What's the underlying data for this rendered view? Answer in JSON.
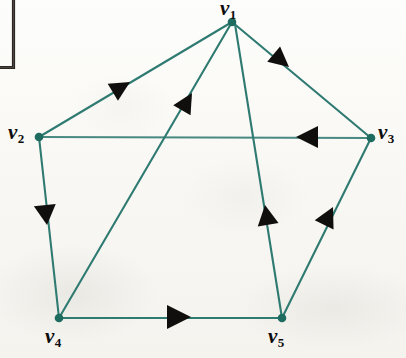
{
  "figure": {
    "kind": "directed-graph-diagram",
    "background_color": "#fbfbf8",
    "edge_color": "#2f7a71",
    "vertex_color": "#1e6b60",
    "arrow_color": "#100f0d",
    "label_color": "#0d0d0d"
  },
  "corner_bracket": {
    "name": "corner-bracket-mark",
    "color": "#2a2622",
    "x": 13,
    "y_top": 0,
    "y_bottom": 68,
    "x_left": 0
  },
  "vertices": [
    {
      "id": "v1",
      "label": "v",
      "subscript": "1",
      "cx": 232,
      "cy": 22,
      "label_x": 220,
      "label_y": -2
    },
    {
      "id": "v2",
      "label": "v",
      "subscript": "2",
      "cx": 39,
      "cy": 137,
      "label_x": 8,
      "label_y": 122
    },
    {
      "id": "v3",
      "label": "v",
      "subscript": "3",
      "cx": 371,
      "cy": 138,
      "label_x": 378,
      "label_y": 122
    },
    {
      "id": "v4",
      "label": "v",
      "subscript": "4",
      "cx": 59,
      "cy": 318,
      "label_x": 45,
      "label_y": 326
    },
    {
      "id": "v5",
      "label": "v",
      "subscript": "5",
      "cx": 282,
      "cy": 318,
      "label_x": 268,
      "label_y": 326
    }
  ],
  "edges": [
    {
      "name": "edge-v2-to-v1",
      "from": "v2",
      "to": "v1",
      "directed": true,
      "arrow_at": {
        "x": 130,
        "y": 82
      }
    },
    {
      "name": "edge-v4-to-v1",
      "from": "v4",
      "to": "v1",
      "directed": true,
      "arrow_at": {
        "x": 190,
        "y": 92
      }
    },
    {
      "name": "edge-v1-to-v3",
      "from": "v1",
      "to": "v3",
      "directed": true,
      "arrow_at": {
        "x": 288,
        "y": 66
      }
    },
    {
      "name": "edge-v3-to-v2",
      "from": "v3",
      "to": "v2",
      "directed": true,
      "arrow_at": {
        "x": 306,
        "y": 137
      }
    },
    {
      "name": "edge-v2-to-v4",
      "from": "v2",
      "to": "v4",
      "directed": true,
      "arrow_at": {
        "x": 46,
        "y": 221
      }
    },
    {
      "name": "edge-v5-to-v1",
      "from": "v5",
      "to": "v1",
      "directed": true,
      "arrow_at": {
        "x": 266,
        "y": 210
      }
    },
    {
      "name": "edge-v5-to-v3",
      "from": "v5",
      "to": "v3",
      "directed": true,
      "arrow_at": {
        "x": 331,
        "y": 211
      }
    },
    {
      "name": "edge-v4-to-v5",
      "from": "v4",
      "to": "v5",
      "directed": true,
      "arrow_at": {
        "x": 180,
        "y": 317
      }
    }
  ]
}
